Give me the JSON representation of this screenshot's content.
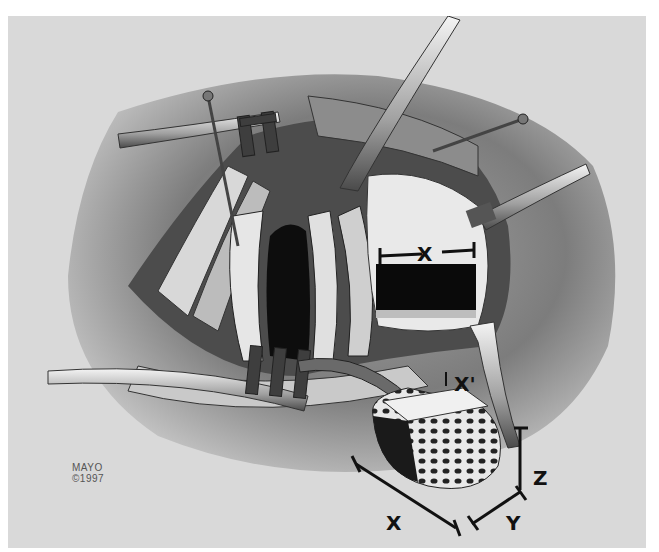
{
  "illustration": {
    "description": "Surgical illustration: retracted incision exposing spinal column with rectangular defect and a cancellous bone graft block with dimensions",
    "palette": {
      "background": "#d9d9d9",
      "tissue_dark": "#3a3a3a",
      "tissue_mid": "#8a8a8a",
      "tissue_light": "#efefef",
      "label": "#111111"
    }
  },
  "labels": {
    "defect_width": "X",
    "defect_width_prime": "X'",
    "graft_length": "X",
    "graft_width": "Y",
    "graft_height": "Z"
  },
  "credit": {
    "line1": "MAYO",
    "line2": "©1997"
  }
}
